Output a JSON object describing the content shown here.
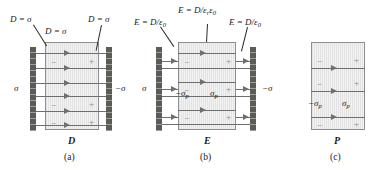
{
  "panels": [
    {
      "id": "a",
      "caption": "(a)",
      "field_symbol": "D",
      "labels": {
        "top_left": "D = σ",
        "top_center": "D = σ",
        "top_right": "D = σ",
        "left_plate_charge": "σ",
        "right_plate_charge": "−σ"
      },
      "bound_charge_left": "−",
      "bound_charge_right": "+",
      "field_line_count": 6
    },
    {
      "id": "b",
      "caption": "(b)",
      "field_symbol": "E",
      "labels": {
        "top_left": "E = D/ε",
        "top_left_sub": "0",
        "top_center": "E = D/ε",
        "top_center_sub1": "r",
        "top_center_sub2": "0",
        "top_center_eps2": "ε",
        "top_right": "E = D/ε",
        "top_right_sub": "0",
        "left_plate_charge": "σ",
        "right_plate_charge": "−σ",
        "bound_left": "−σ",
        "bound_left_sub": "p",
        "bound_right": "σ",
        "bound_right_sub": "p"
      },
      "bound_charge_left": "−",
      "bound_charge_right": "+",
      "field_line_count": 3
    },
    {
      "id": "c",
      "caption": "(c)",
      "field_symbol": "P",
      "labels": {
        "bound_left": "−σ",
        "bound_left_sub": "p",
        "bound_right": "σ",
        "bound_right_sub": "p"
      },
      "bound_charge_left": "−",
      "bound_charge_right": "+",
      "field_line_count": 3
    }
  ],
  "colors": {
    "plate": "#5d5b58",
    "slab": "#e3e3e3",
    "slab_border": "#8e8e8e",
    "field_line": "#6f6f6f",
    "text": "#1a1a1a",
    "sign": "#8a8a8a",
    "background": "#ffffff"
  }
}
